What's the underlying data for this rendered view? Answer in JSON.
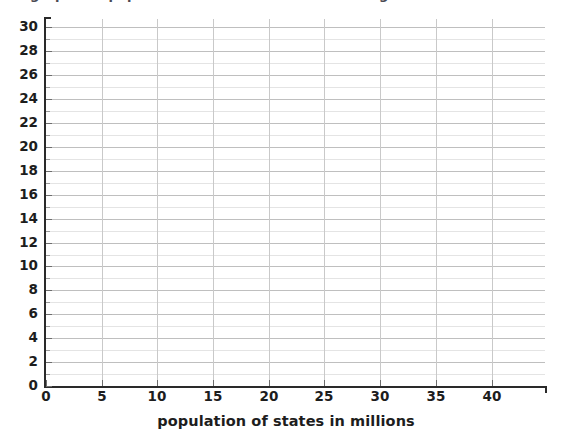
{
  "top_caption": {
    "clipped_text": "graph the population of states in millions using",
    "note": "partially cropped line of text at very top edge"
  },
  "chart_data": {
    "type": "scatter",
    "title": "",
    "subtitle": "",
    "xlabel": "population of states in millions",
    "ylabel": "",
    "xlim": [
      0,
      44.8
    ],
    "ylim": [
      0,
      30.7
    ],
    "x": [],
    "y": [],
    "series": [],
    "categories": [],
    "values": [],
    "x_ticks": [
      0,
      5,
      10,
      15,
      20,
      25,
      30,
      35,
      40
    ],
    "x_tick_labels": [
      "0",
      "5",
      "10",
      "15",
      "20",
      "25",
      "30",
      "35",
      "40"
    ],
    "x_minor_step": 1,
    "y_ticks": [
      0,
      2,
      4,
      6,
      8,
      10,
      12,
      14,
      16,
      18,
      20,
      22,
      24,
      26,
      28,
      30
    ],
    "y_tick_labels": [
      "0",
      "2",
      "4",
      "6",
      "8",
      "10",
      "12",
      "14",
      "16",
      "18",
      "20",
      "22",
      "24",
      "26",
      "28",
      "30"
    ],
    "y_minor_ticks": [
      1,
      3,
      5,
      7,
      9,
      11,
      13,
      15,
      17,
      19,
      21,
      23,
      25,
      27,
      29
    ],
    "grid": {
      "horizontal": true,
      "horizontal_step": 1,
      "vertical": true,
      "vertical_step": 5,
      "major_color": "#bfbfbf",
      "minor_color": "#e4e4e4"
    },
    "legend": {
      "entries": [],
      "position": "none"
    },
    "annotations": [],
    "empty_plot": true,
    "colors": {
      "background": "#ffffff",
      "axis": "#2a2a2a",
      "text": "#1d1d1d",
      "grid_major": "#bfbfbf",
      "grid_minor": "#e4e4e4"
    }
  }
}
